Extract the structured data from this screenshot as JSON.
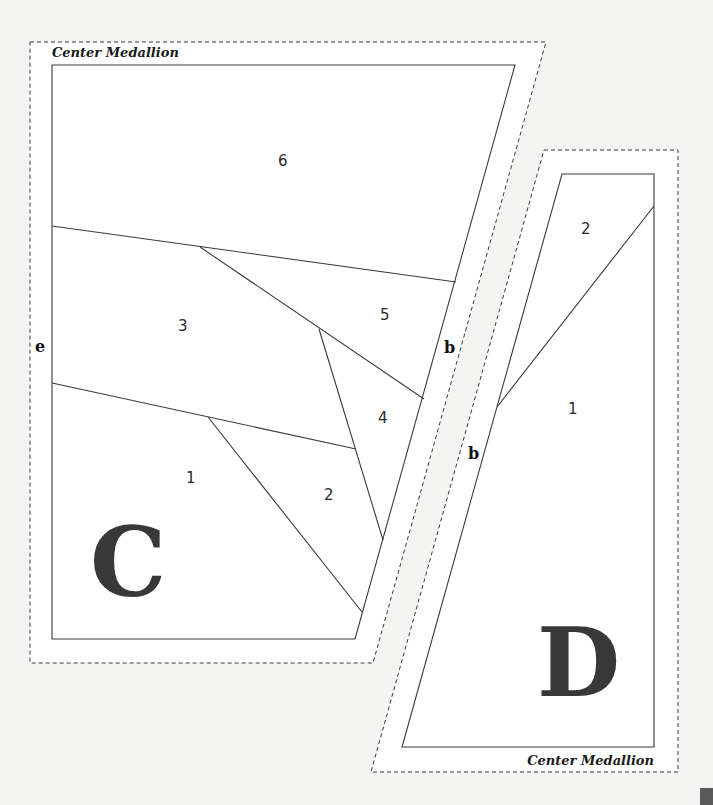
{
  "diagram": {
    "type": "foundation-paper-piecing-pattern",
    "units": [
      {
        "id": "C",
        "label": "C",
        "title": "Center Medallion",
        "edge_labels": {
          "left": "e",
          "right": "b"
        },
        "pieces": [
          {
            "number": "1"
          },
          {
            "number": "2"
          },
          {
            "number": "3"
          },
          {
            "number": "4"
          },
          {
            "number": "5"
          },
          {
            "number": "6"
          }
        ]
      },
      {
        "id": "D",
        "label": "D",
        "title": "Center Medallion",
        "edge_labels": {
          "left": "b"
        },
        "pieces": [
          {
            "number": "1"
          },
          {
            "number": "2"
          }
        ]
      }
    ],
    "legend": {
      "solid_line": "sewing line",
      "dashed_line": "cutting line (seam allowance)"
    },
    "colors": {
      "line": "#3a3a3a",
      "unit_letter": "#383838",
      "background": "#f4f4f3",
      "paper": "#ffffff"
    }
  }
}
